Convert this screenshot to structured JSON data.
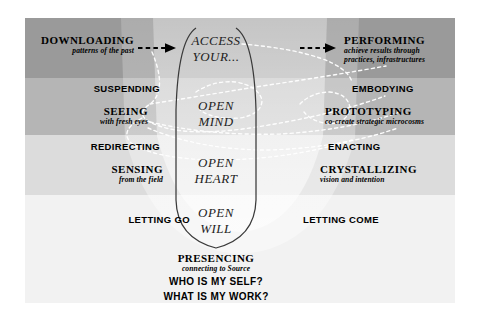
{
  "diagram": {
    "colors": {
      "band1": "#9a9a9a",
      "band2": "#b5b5b5",
      "band3": "#dcdcdc",
      "band4": "#f2f2f2",
      "funnel": "#ffffff",
      "dashed_curve": "#ffffff",
      "u_curve": "#333333",
      "arrow": "#000000",
      "text": "#1a1a1a"
    }
  },
  "center": {
    "access": {
      "line1": "ACCESS",
      "line2": "YOUR..."
    },
    "mind": {
      "line1": "OPEN",
      "line2": "MIND"
    },
    "heart": {
      "line1": "OPEN",
      "line2": "HEART"
    },
    "will": {
      "line1": "OPEN",
      "line2": "WILL"
    },
    "presencing": {
      "title": "PRESENCING",
      "sub": "connecting to Source"
    },
    "questions": {
      "q1": "WHO IS MY SELF?",
      "q2": "WHAT IS MY WORK?"
    }
  },
  "left": {
    "downloading": {
      "title": "DOWNLOADING",
      "sub": "patterns of the past"
    },
    "suspending": {
      "title": "SUSPENDING"
    },
    "seeing": {
      "title": "SEEING",
      "sub": "with fresh eyes"
    },
    "redirecting": {
      "title": "REDIRECTING"
    },
    "sensing": {
      "title": "SENSING",
      "sub": "from the field"
    },
    "letting_go": {
      "title": "LETTING GO"
    }
  },
  "right": {
    "performing": {
      "title": "PERFORMING",
      "sub1": "achieve results through",
      "sub2": "practices, infrastructures"
    },
    "embodying": {
      "title": "EMBODYING"
    },
    "prototyping": {
      "title": "PROTOTYPING",
      "sub": "co-create strategic microcosms"
    },
    "enacting": {
      "title": "ENACTING"
    },
    "crystallizing": {
      "title": "CRYSTALLIZING",
      "sub": "vision and intention"
    },
    "letting_come": {
      "title": "LETTING COME"
    }
  },
  "arrows": {
    "left_arrow": "dashed-arrow-right",
    "right_arrow": "dashed-arrow-right"
  }
}
